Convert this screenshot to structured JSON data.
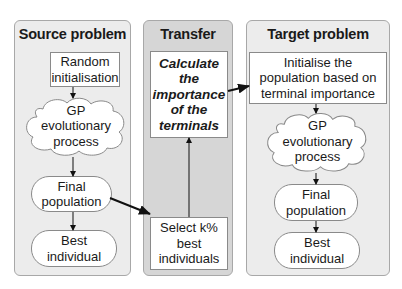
{
  "panels": {
    "source": {
      "title": "Source problem",
      "nodes": {
        "init": "Random initialisation",
        "gp": "GP evolutionary process",
        "final": "Final population",
        "best": "Best individual"
      }
    },
    "transfer": {
      "title": "Transfer",
      "nodes": {
        "calc": "Calculate the importance of the terminals",
        "select": "Select k% best individuals"
      }
    },
    "target": {
      "title": "Target problem",
      "nodes": {
        "init": "Initialise the population based on terminal importance",
        "gp": "GP evolutionary process",
        "final": "Final population",
        "best": "Best individual"
      }
    }
  },
  "lines": {
    "source_init": [
      "Random",
      "initialisation"
    ],
    "source_gp": [
      "GP",
      "evolutionary",
      "process"
    ],
    "source_final": [
      "Final",
      "population"
    ],
    "source_best": [
      "Best",
      "individual"
    ],
    "transfer_calc": [
      "Calculate",
      "the",
      "importance",
      "of the",
      "terminals"
    ],
    "transfer_select": [
      "Select k%",
      "best",
      "individuals"
    ],
    "target_init": [
      "Initialise the",
      "population based on",
      "terminal importance"
    ],
    "target_gp": [
      "GP",
      "evolutionary",
      "process"
    ],
    "target_final": [
      "Final",
      "population"
    ],
    "target_best": [
      "Best",
      "individual"
    ]
  },
  "colors": {
    "panel_light": "#ececec",
    "panel_dark": "#d6d6d6",
    "border": "#a8a8a8",
    "node_fill": "#ffffff",
    "arrow": "#111111"
  }
}
